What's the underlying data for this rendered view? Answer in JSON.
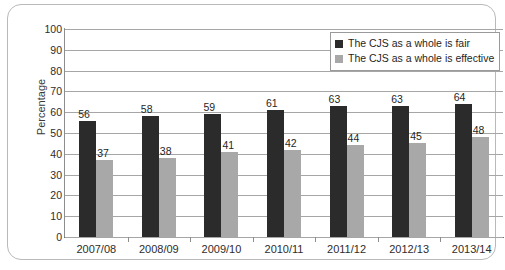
{
  "chart_data": {
    "type": "bar",
    "title": "",
    "subtitle": "",
    "xlabel": "",
    "ylabel": "Percentage",
    "ylim": [
      0,
      100
    ],
    "ytick_step": 10,
    "yticks": [
      100,
      90,
      80,
      70,
      60,
      50,
      40,
      30,
      20,
      10,
      0
    ],
    "grid": true,
    "legend_position": "top-right",
    "categories": [
      "2007/08",
      "2008/09",
      "2009/10",
      "2010/11",
      "2011/12",
      "2012/13",
      "2013/14"
    ],
    "series": [
      {
        "name": "The CJS as a whole is fair",
        "color": "#2b2b2b",
        "values": [
          56,
          58,
          59,
          61,
          63,
          63,
          64
        ]
      },
      {
        "name": "The CJS as a whole is effective",
        "color": "#a8a8a8",
        "values": [
          37,
          38,
          41,
          42,
          44,
          45,
          48
        ]
      }
    ]
  },
  "legend": {
    "items": [
      {
        "label": "The CJS as a whole is fair",
        "swatch": "dark"
      },
      {
        "label": "The CJS as a whole is effective",
        "swatch": "light"
      }
    ]
  },
  "colors": {
    "series_fair": "#2b2b2b",
    "series_effective": "#a8a8a8",
    "gridline": "#a6a6a6",
    "axis": "#8d8d8d",
    "frame": "#b9b9b9",
    "background": "#ffffff"
  }
}
